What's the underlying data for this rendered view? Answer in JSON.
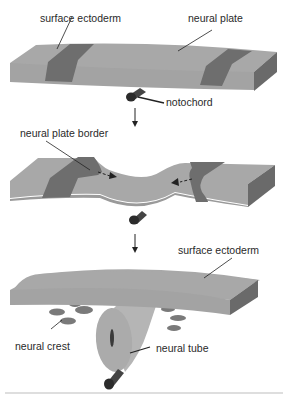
{
  "colors": {
    "plate_top": "#a8a8a8",
    "plate_side": "#999999",
    "border_region": "#6e6e6e",
    "side_dark": "#6a6a6a",
    "notochord": "#333333",
    "neural_crest": "#7a7a7a",
    "tube": "#b0b0b0",
    "line": "#222222"
  },
  "stages": [
    {
      "name": "stage-1-neural-plate",
      "labels": {
        "surface_ectoderm": "surface ectoderm",
        "neural_plate": "neural plate",
        "notochord": "notochord"
      }
    },
    {
      "name": "stage-2-folding",
      "labels": {
        "neural_plate_border": "neural plate border"
      }
    },
    {
      "name": "stage-3-neural-tube",
      "labels": {
        "surface_ectoderm": "surface ectoderm",
        "neural_crest": "neural crest",
        "neural_tube": "neural tube"
      }
    }
  ]
}
